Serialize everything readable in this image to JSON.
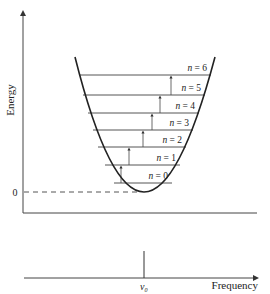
{
  "figure": {
    "ylabel": "Energy",
    "zero_label": "0",
    "xlabel": "Frequency",
    "peak_label": "ν",
    "peak_subscript": "0",
    "levels": [
      {
        "n_label": "n",
        "eq": " = ",
        "value": "0",
        "y": 183,
        "xl": 114,
        "xr": 172,
        "arrow_x": 121
      },
      {
        "n_label": "n",
        "eq": " = ",
        "value": "1",
        "y": 165,
        "xl": 105,
        "xr": 180,
        "arrow_x": 129
      },
      {
        "n_label": "n",
        "eq": " = ",
        "value": "2",
        "y": 147,
        "xl": 98,
        "xr": 186,
        "arrow_x": 143
      },
      {
        "n_label": "n",
        "eq": " = ",
        "value": "3",
        "y": 130,
        "xl": 93,
        "xr": 193,
        "arrow_x": 152
      },
      {
        "n_label": "n",
        "eq": " = ",
        "value": "4",
        "y": 113,
        "xl": 88,
        "xr": 199,
        "arrow_x": 160
      },
      {
        "n_label": "n",
        "eq": " = ",
        "value": "5",
        "y": 95,
        "xl": 83,
        "xr": 205,
        "arrow_x": 171
      },
      {
        "n_label": "n",
        "eq": " = ",
        "value": "6",
        "y": 75,
        "xl": 79,
        "xr": 211,
        "arrow_x": null
      }
    ]
  },
  "chart_data": {
    "type": "diagram",
    "title": "",
    "top_panel": {
      "description": "Harmonic oscillator potential well (parabola) with equally spaced energy levels and upward transition arrows",
      "ylabel": "Energy",
      "y_tick_labels": [
        "0"
      ],
      "levels": [
        "n = 0",
        "n = 1",
        "n = 2",
        "n = 3",
        "n = 4",
        "n = 5",
        "n = 6"
      ],
      "transitions": [
        "0→1",
        "1→2",
        "2→3",
        "3→4",
        "4→5",
        "5→6"
      ]
    },
    "bottom_panel": {
      "description": "Spectrum showing a single line at frequency ν0",
      "xlabel": "Frequency",
      "x_tick_labels": [
        "ν0"
      ],
      "lines": [
        {
          "x": "ν0"
        }
      ]
    }
  }
}
